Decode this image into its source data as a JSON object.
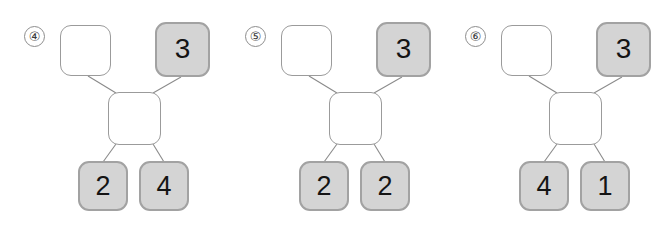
{
  "page": {
    "background_color": "#ffffff",
    "width": 662,
    "height": 233
  },
  "style": {
    "empty_fill": "#ffffff",
    "empty_border": "#9b9b9b",
    "filled_fill": "#d4d4d4",
    "filled_border": "#a2a2a2",
    "connector_color": "#8a8a8a",
    "digit_color": "#141414",
    "badge_border": "#8d8d8d"
  },
  "puzzles": [
    {
      "index_label": "④",
      "offset_x": 0,
      "top_left": {
        "value": "",
        "state": "empty"
      },
      "top_right": {
        "value": "3",
        "state": "filled"
      },
      "middle": {
        "value": "",
        "state": "empty"
      },
      "bottom_left": {
        "value": "2",
        "state": "filled"
      },
      "bottom_right": {
        "value": "4",
        "state": "filled"
      }
    },
    {
      "index_label": "⑤",
      "offset_x": 221,
      "top_left": {
        "value": "",
        "state": "empty"
      },
      "top_right": {
        "value": "3",
        "state": "filled"
      },
      "middle": {
        "value": "",
        "state": "empty"
      },
      "bottom_left": {
        "value": "2",
        "state": "filled"
      },
      "bottom_right": {
        "value": "2",
        "state": "filled"
      }
    },
    {
      "index_label": "⑥",
      "offset_x": 441,
      "top_left": {
        "value": "",
        "state": "empty"
      },
      "top_right": {
        "value": "3",
        "state": "filled"
      },
      "middle": {
        "value": "",
        "state": "empty"
      },
      "bottom_left": {
        "value": "4",
        "state": "filled"
      },
      "bottom_right": {
        "value": "1",
        "state": "filled"
      }
    }
  ]
}
